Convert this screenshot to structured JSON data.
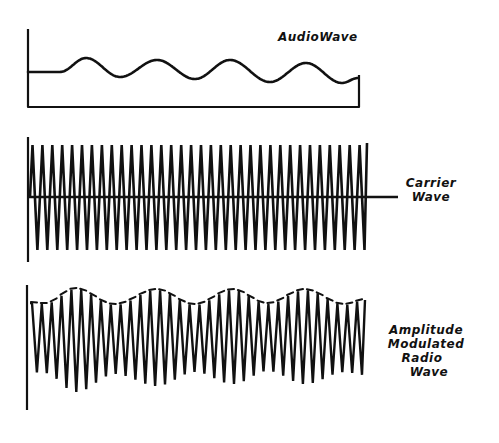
{
  "diagram": {
    "ink_color": "#111111",
    "background": "#ffffff",
    "panels": [
      {
        "id": "audio",
        "label_lines": [
          "AudioWave"
        ],
        "description": "Low-frequency audio signal drawn on an L-shaped axis with a closed right edge"
      },
      {
        "id": "carrier",
        "label_lines": [
          "Carrier",
          "Wave"
        ],
        "description": "High-frequency constant-amplitude carrier wave centered on a horizontal axis"
      },
      {
        "id": "am",
        "label_lines": [
          "Amplitude",
          "Modulated",
          "Radio",
          "Wave"
        ],
        "description": "Carrier wave whose amplitude follows the audio wave envelope"
      }
    ]
  },
  "audio": {
    "label": "AudioWave",
    "axis": {
      "x": 28,
      "top": 29,
      "bottom": 107,
      "right": 359
    },
    "baseline_y": 72,
    "flat_until_x": 60,
    "points": [
      [
        28,
        72
      ],
      [
        60,
        72
      ],
      [
        86,
        58
      ],
      [
        120,
        77
      ],
      [
        157,
        60
      ],
      [
        195,
        79
      ],
      [
        230,
        60
      ],
      [
        270,
        82
      ],
      [
        306,
        63
      ],
      [
        342,
        83
      ],
      [
        358,
        78
      ]
    ]
  },
  "carrier": {
    "label_line1": "Carrier",
    "label_line2": "Wave",
    "axis": {
      "x": 28,
      "top": 137,
      "bottom": 262
    },
    "center_y": 197,
    "line_end_x": 398,
    "start_x": 30,
    "end_x": 367,
    "cycles": 34,
    "peak_top_y": 145,
    "peak_bottom_y": 250
  },
  "am": {
    "label_line1": "Amplitude",
    "label_line2": "Modulated",
    "label_line3": "Radio",
    "label_line4": "Wave",
    "axis": {
      "x": 27,
      "top": 285,
      "bottom": 410
    },
    "center_y": 342,
    "start_x": 30,
    "end_x": 365,
    "cycles": 34,
    "envelope_top": [
      [
        30,
        303
      ],
      [
        45,
        304
      ],
      [
        76,
        289
      ],
      [
        115,
        305
      ],
      [
        157,
        290
      ],
      [
        195,
        305
      ],
      [
        233,
        290
      ],
      [
        268,
        304
      ],
      [
        305,
        290
      ],
      [
        345,
        305
      ],
      [
        365,
        300
      ]
    ],
    "envelope_bottom": [
      [
        30,
        372
      ],
      [
        45,
        373
      ],
      [
        76,
        392
      ],
      [
        115,
        374
      ],
      [
        157,
        386
      ],
      [
        195,
        372
      ],
      [
        233,
        384
      ],
      [
        268,
        371
      ],
      [
        305,
        384
      ],
      [
        345,
        372
      ],
      [
        365,
        375
      ]
    ]
  }
}
